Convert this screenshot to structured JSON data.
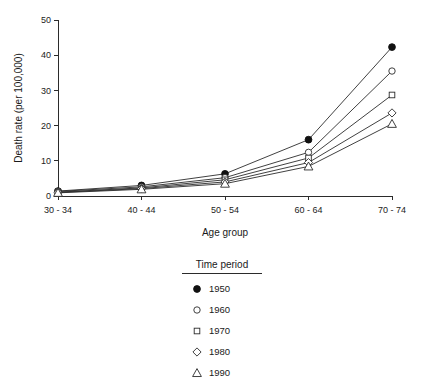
{
  "chart_data": {
    "type": "line",
    "title": "",
    "xlabel": "Age group",
    "ylabel": "Death rate (per 100,000)",
    "categories": [
      "30 - 34",
      "40 - 44",
      "50 - 54",
      "60 - 64",
      "70 - 74"
    ],
    "yticks": [
      "0",
      "10",
      "20",
      "30",
      "40",
      "50"
    ],
    "ylim": [
      0,
      50
    ],
    "grid": false,
    "legend_position": "below-center",
    "legend_title": "Time period",
    "series": [
      {
        "name": "1950",
        "marker": "filled-circle",
        "values": [
          1.4,
          3.0,
          6.3,
          16.0,
          42.3
        ]
      },
      {
        "name": "1960",
        "marker": "open-circle",
        "values": [
          1.3,
          2.6,
          5.2,
          12.4,
          35.5
        ]
      },
      {
        "name": "1970",
        "marker": "open-square",
        "values": [
          1.1,
          2.3,
          4.6,
          10.8,
          28.7
        ]
      },
      {
        "name": "1980",
        "marker": "open-diamond",
        "values": [
          1.0,
          2.1,
          4.0,
          9.5,
          23.6
        ]
      },
      {
        "name": "1990",
        "marker": "open-triangle",
        "values": [
          0.9,
          1.9,
          3.5,
          8.4,
          20.5
        ]
      }
    ]
  }
}
